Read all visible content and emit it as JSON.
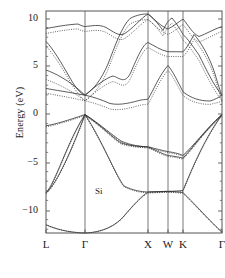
{
  "figure": {
    "system_label": "Si",
    "ylabel": "Energy (eV)",
    "frame": {
      "left": 46,
      "right": 222,
      "top": 11,
      "bottom": 233
    },
    "line_color": "#262626",
    "frame_color": "#555555"
  },
  "chart_data": {
    "type": "line",
    "title": "",
    "xlabel": "",
    "ylabel": "Energy (eV)",
    "ylim": [
      -12.6,
      11.4
    ],
    "yticks": [
      10,
      5,
      0,
      -5,
      -10
    ],
    "ytick_labels": [
      "10",
      "5",
      "0",
      "−5",
      "−10"
    ],
    "grid": false,
    "legend": null,
    "annotations": [
      "Si"
    ],
    "xticks": [
      0.0,
      0.5,
      1.0,
      1.25,
      1.4,
      2.0
    ],
    "xtick_labels": [
      "L",
      "Γ",
      "X",
      "W",
      "K",
      "Γ"
    ],
    "kpath_fractions": {
      "L": 0.0,
      "G1": 0.222,
      "X": 0.58,
      "W": 0.693,
      "K": 0.778,
      "G2": 1.0
    },
    "x": [
      0.0,
      0.222,
      0.58,
      0.693,
      0.778,
      1.0
    ],
    "series": [
      {
        "name": "v1-solid",
        "style": "solid",
        "values": [
          -9.9,
          -12.2,
          -8.0,
          -7.8,
          -8.1,
          0.0
        ]
      },
      {
        "name": "v2-solid",
        "style": "solid",
        "values": [
          -7.1,
          -0.05,
          -8.0,
          -7.8,
          -8.1,
          0.0
        ]
      },
      {
        "name": "v3-solid",
        "style": "solid",
        "values": [
          -7.1,
          -0.05,
          -2.9,
          -3.9,
          -4.8,
          0.0
        ]
      },
      {
        "name": "v4-solid",
        "style": "solid",
        "values": [
          -1.2,
          -0.05,
          -2.9,
          -3.4,
          -4.3,
          0.0
        ]
      },
      {
        "name": "c1-solid",
        "style": "solid",
        "values": [
          7.4,
          3.3,
          1.4,
          5.2,
          2.1,
          3.3
        ]
      },
      {
        "name": "c2-solid",
        "style": "solid",
        "values": [
          4.3,
          3.3,
          6.5,
          5.2,
          8.8,
          3.3
        ]
      },
      {
        "name": "c3-solid",
        "style": "solid",
        "values": [
          2.3,
          3.3,
          10.6,
          6.3,
          8.8,
          3.3
        ]
      },
      {
        "name": "c4-solid",
        "style": "solid",
        "values": [
          8.6,
          8.9,
          10.6,
          9.0,
          8.8,
          8.9
        ]
      },
      {
        "name": "v1-dotted",
        "style": "dotted",
        "values": [
          -9.9,
          -12.2,
          -8.1,
          -7.9,
          -8.2,
          -0.1
        ]
      },
      {
        "name": "v2-dotted",
        "style": "dotted",
        "values": [
          -7.2,
          -0.15,
          -8.1,
          -7.9,
          -8.2,
          -0.1
        ]
      },
      {
        "name": "v3-dotted",
        "style": "dotted",
        "values": [
          -7.2,
          -0.15,
          -3.0,
          -4.0,
          -4.9,
          -0.1
        ]
      },
      {
        "name": "v4-dotted",
        "style": "dotted",
        "values": [
          -1.3,
          -0.15,
          -3.0,
          -3.5,
          -4.4,
          -0.1
        ]
      },
      {
        "name": "c1-dotted",
        "style": "dotted",
        "values": [
          6.9,
          2.7,
          0.8,
          4.7,
          1.9,
          2.7
        ]
      },
      {
        "name": "c2-dotted",
        "style": "dotted",
        "values": [
          3.4,
          2.7,
          6.0,
          4.7,
          8.3,
          2.7
        ]
      },
      {
        "name": "c3-dotted",
        "style": "dotted",
        "values": [
          1.8,
          2.7,
          10.1,
          5.8,
          8.3,
          2.7
        ]
      },
      {
        "name": "c4-dotted",
        "style": "dotted",
        "values": [
          8.1,
          8.2,
          10.1,
          8.4,
          8.2,
          8.2
        ]
      }
    ],
    "band_paths_solid": [
      "M46,224.7 C54,228.5 68,232.6 85,233.0 C102,232.6 116,225.6 124,216.0 C133,205.4 141,196.6 148,192.0 C155,191.7 162,191.6 168,191.4 C173,191.4 178,192.0 183,192.6 C193,202.0 205,216.0 222,232.3",
      "M46,192.6 C55,184.0 68,140.0 85,114.5 C102,140.0 116,176.0 124,186.0 C133,190.5 141,191.8 148,192.0 C155,191.7 162,191.5 168,191.3 C174,191.2 179,191.0 183,190.4 C193,166.0 205,138.0 222,114.5",
      "M46,192.6 C54,187.0 68,160.0 85,114.5 C100,124.0 112,135.0 121,141.0 C131,145.5 141,146.5 148,146.8 C155,150.0 162,153.8 168,155.5 C174,156.2 179,157.0 183,158.2 C193,148.0 205,130.0 222,114.5",
      "M46,125.8 C54,124.5 68,120.5 85,114.5 C100,124.5 113,138.0 121,143.0 C131,146.2 141,146.6 148,146.8 C155,148.5 162,150.5 168,151.6 C174,152.6 179,153.6 183,155.4 C193,146.5 205,130.0 222,114.5",
      "M46,41.3 C53,49.0 61,62.0 70,78.0 C76,88.5 81,94.0 85,95.2 C92,96.6 101,99.5 110,103.5 C121,105.9 133,102.0 141,100.0 C145,99.5 147,99.3 148,99.2 C153,91.0 160,74.0 168,65.5 C173,71.5 178,82.0 183,91.8 C191,98.3 200,101.0 210,101.0 C215,99.6 219,97.2 222,95.2",
      "M46,70.0 C54,73.0 68,79.0 85,95.2 C97,85.0 106,78.0 113,76.0 C120,78.0 125,85.0 131,72.0 C137,58.0 143,44.0 148,42.5 C154,45.5 161,50.5 168,51.7 C173,51.8 178,51.8 183,51.8 C187,48.0 190,42.0 194,34.5 C201,42.0 210,58.0 215,74.0 C218,84.0 220,91.0 222,95.2",
      "M46,88.4 C54,90.0 68,92.0 85,95.2 C94,89.0 101,80.0 108,64.0 C115,46.0 122,26.0 130,18.5 C137,14.6 144,13.8 148,14.0 C152,16.5 158,23.5 163,30.5 C166,23.8 169,19.5 172,18.0 C177,24.0 180,29.0 183,34.5 C188,39.0 193,46.5 199,55.0 C206,69.0 214,86.0 222,95.2",
      "M46,28.6 C54,27.0 68,24.5 78,24.0 C81,25.5 83,26.4 85,26.5 C92,26.0 99,24.0 106,27.5 C113,31.5 119,36.5 124,34.0 C133,28.5 141,18.0 148,14.0 C154,19.0 161,26.5 168,29.0 C173,26.5 178,22.5 183,19.0 C188,25.0 193,34.0 199,36.5 C206,34.0 214,29.0 222,26.5"
    ],
    "band_paths_dotted": [
      "M46,224.7 C54,228.6 68,232.7 85,233.1 C102,232.7 116,225.8 124,216.4 C133,205.9 141,197.2 148,192.9 C155,192.6 162,192.5 168,192.3 C173,192.3 178,192.9 183,193.5 C193,202.8 205,216.6 222,232.6",
      "M46,193.6 C55,185.0 68,141.0 85,115.5 C102,141.0 116,176.8 124,186.8 C133,191.3 141,192.6 148,192.9 C155,192.6 162,192.4 168,192.2 C174,192.1 179,191.9 183,191.3 C193,167.0 205,139.0 222,115.5",
      "M46,193.6 C54,188.0 68,161.0 85,115.5 C100,125.0 112,136.0 121,142.0 C131,146.4 141,147.5 148,147.8 C155,151.0 162,154.8 168,156.5 C174,157.2 179,158.0 183,159.2 C193,149.0 205,131.0 222,115.5",
      "M46,126.8 C54,125.5 68,121.5 85,115.5 C100,125.5 113,139.0 121,144.0 C131,147.2 141,147.6 148,147.8 C155,149.5 162,151.5 168,152.6 C174,153.6 179,154.6 183,156.4 C193,147.5 205,131.0 222,115.5",
      "M46,46.0 C53,53.5 61,66.0 70,81.5 C76,91.5 81,97.5 85,100.8 C92,102.4 101,105.2 110,109.0 C121,111.2 133,107.0 141,105.0 C145,104.5 147,104.3 148,104.2 C153,96.0 160,79.0 168,70.3 C173,76.2 178,86.5 183,95.6 C191,101.8 200,104.4 210,104.4 C215,103.2 219,102.6 222,100.8",
      "M46,79.5 C54,82.5 68,88.0 85,100.8 C97,90.5 106,83.5 113,81.5 C120,83.5 125,90.5 131,77.5 C137,63.5 143,49.5 148,47.5 C154,50.5 161,55.5 168,56.5 C173,56.6 178,56.6 183,56.6 C187,52.8 190,47.0 194,39.5 C201,47.0 210,62.5 215,78.5 C218,88.5 220,95.5 222,100.8",
      "M46,93.2 C54,94.8 68,97.0 85,100.8 C94,94.5 101,85.5 108,69.5 C115,51.5 122,31.5 130,24.0 C137,20.2 144,19.4 148,19.6 C152,22.0 158,29.0 163,36.0 C166,29.3 169,25.0 172,23.5 C177,29.5 180,34.5 183,40.0 C188,44.5 193,52.0 199,60.5 C206,74.5 214,91.0 222,100.8",
      "M46,33.5 C54,31.9 68,29.4 78,28.9 C81,30.4 83,31.3 85,31.4 C92,30.9 99,28.9 106,32.4 C113,36.4 119,41.4 124,38.9 C133,33.4 141,23.0 148,19.6 C154,24.5 161,32.0 168,34.5 C173,32.0 178,28.0 183,24.5 C188,30.5 193,39.5 199,42.0 C206,39.5 214,34.5 222,31.4"
    ]
  },
  "yaxis_ticks_px": [
    {
      "label": "10",
      "y": 19
    },
    {
      "label": "5",
      "y": 66
    },
    {
      "label": "0",
      "y": 114
    },
    {
      "label": "−5",
      "y": 163
    },
    {
      "label": "−10",
      "y": 211
    }
  ],
  "xaxis_ticks_px": [
    {
      "label": "L",
      "x": 46
    },
    {
      "label": "Γ",
      "x": 85
    },
    {
      "label": "X",
      "x": 148
    },
    {
      "label": "W",
      "x": 168
    },
    {
      "label": "K",
      "x": 183
    },
    {
      "label": "Γ",
      "x": 222
    }
  ]
}
